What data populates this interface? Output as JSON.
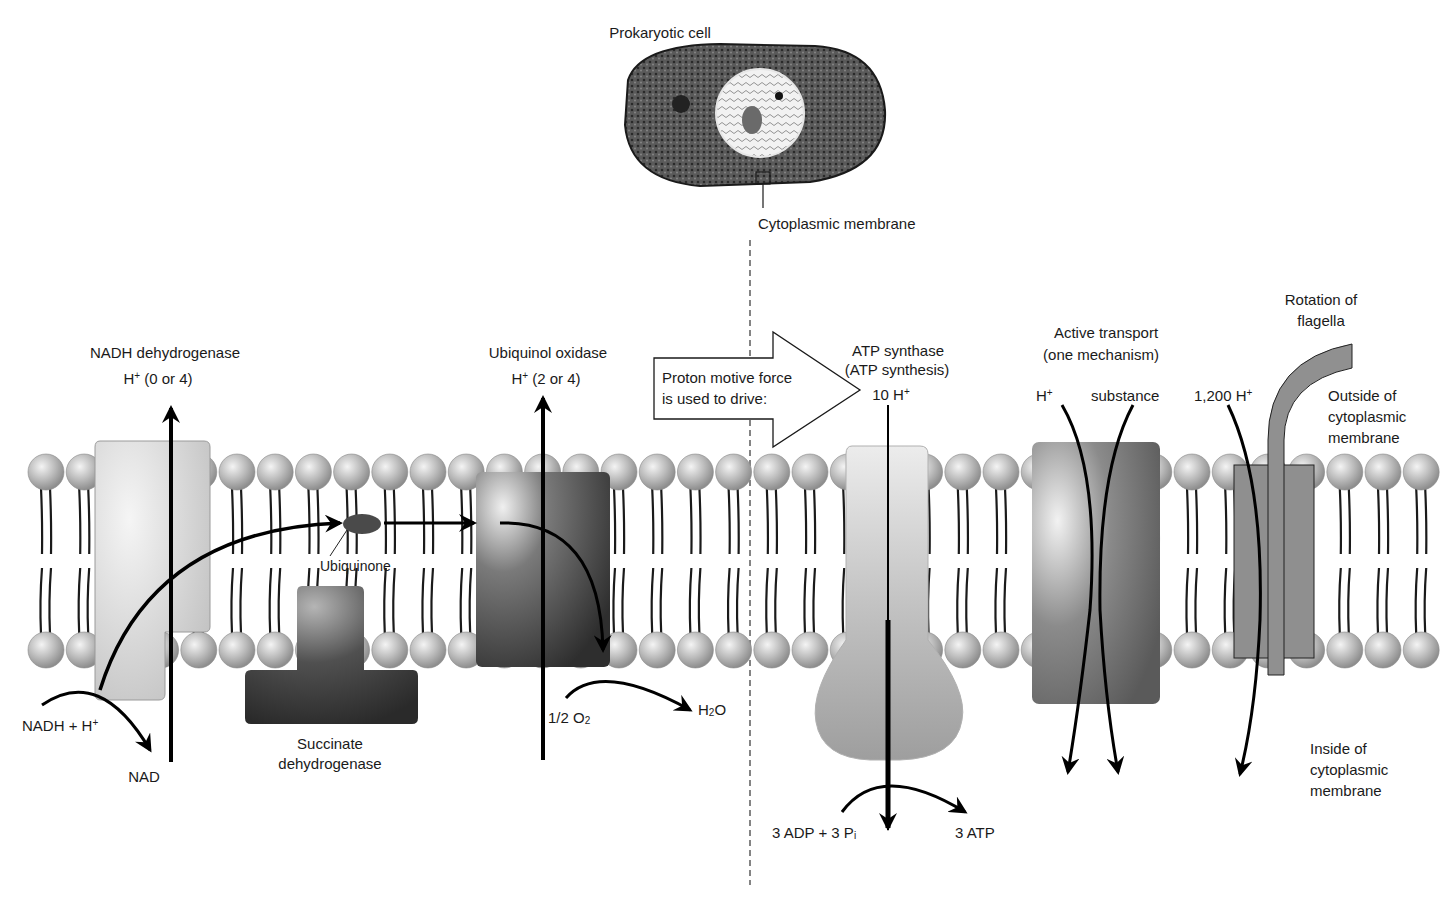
{
  "cell": {
    "title": "Prokaryotic cell",
    "membrane_label": "Cytoplasmic membrane"
  },
  "divider": {
    "style": "dashed",
    "x": 750
  },
  "sides": {
    "outside": {
      "line1": "Outside of",
      "line2": "cytoplasmic",
      "line3": "membrane"
    },
    "inside": {
      "line1": "Inside of",
      "line2": "cytoplasmic",
      "line3": "membrane"
    }
  },
  "electron_transport": {
    "nadh_dehydrogenase": {
      "name": "NADH dehydrogenase",
      "protons": {
        "ion": "H",
        "charge": "+",
        "count": "(0 or 4)"
      },
      "substrate": {
        "text": "NADH + H",
        "charge": "+"
      },
      "product": "NAD"
    },
    "ubiquinone": {
      "name": "Ubiquinone"
    },
    "succinate_dehydrogenase": {
      "line1": "Succinate",
      "line2": "dehydrogenase"
    },
    "ubiquinol_oxidase": {
      "name": "Ubiquinol oxidase",
      "protons": {
        "ion": "H",
        "charge": "+",
        "count": "(2 or 4)"
      },
      "substrate": {
        "prefix": "1/2 O",
        "subscript": "2"
      },
      "product": {
        "prefix": "H",
        "subscript": "2",
        "suffix": "O"
      }
    }
  },
  "pmf_arrow": {
    "line1": "Proton motive force",
    "line2": "is used to drive:"
  },
  "uses": {
    "atp_synthase": {
      "line1": "ATP synthase",
      "line2": "(ATP synthesis)",
      "protons": {
        "count": "10 H",
        "charge": "+"
      },
      "substrate": {
        "text": "3 ADP + 3 P",
        "subscript": "i"
      },
      "product": "3 ATP"
    },
    "active_transport": {
      "line1": "Active transport",
      "line2": "(one mechanism)",
      "proton": {
        "ion": "H",
        "charge": "+"
      },
      "substance": "substance"
    },
    "flagella": {
      "line1": "Rotation of",
      "line2": "flagella",
      "protons": {
        "count": "1,200 H",
        "charge": "+"
      }
    }
  },
  "colors": {
    "lipid_head": "#b8b8b8",
    "lipid_tail": "#1a1a1a",
    "nadh_dh": "#cfcfcf",
    "succinate_dh": "#3c3c3c",
    "ubiquinol_ox": "#4a4a4a",
    "atp_synthase": "#a9a9a9",
    "transporter": "#6e6e6e",
    "flagellar_motor": "#8f8f8f",
    "arrow": "#000000"
  }
}
